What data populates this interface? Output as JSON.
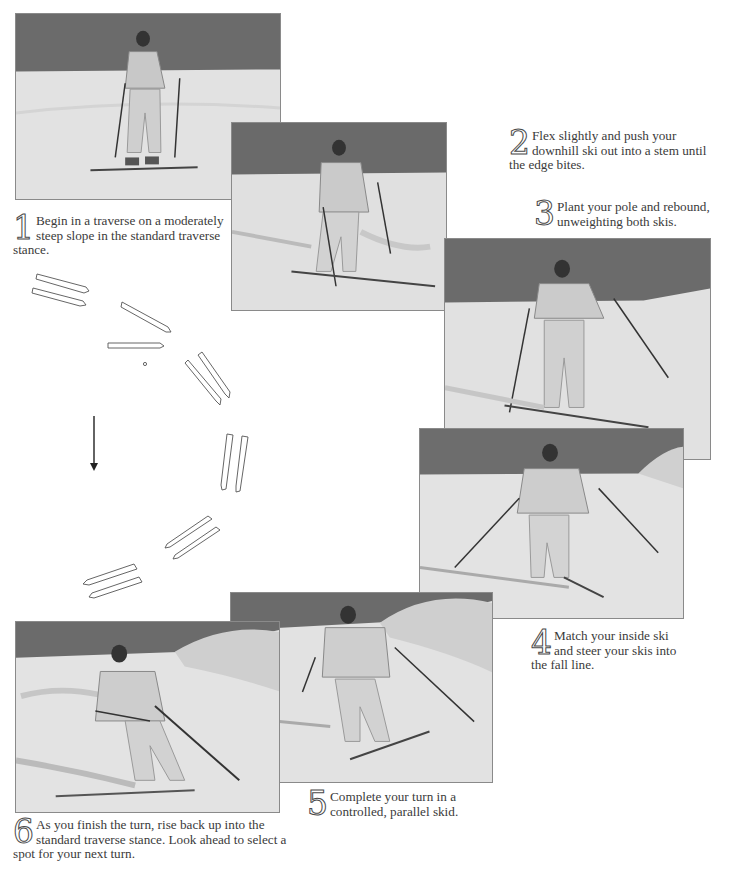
{
  "steps": [
    {
      "number": "1",
      "text": "Begin in a traverse on a moderately steep slope in the standard traverse stance."
    },
    {
      "number": "2",
      "text": "Flex slightly and push your downhill ski out into a stem until the edge bites."
    },
    {
      "number": "3",
      "text": "Plant your pole and rebound, unweighting both skis."
    },
    {
      "number": "4",
      "text": "Match your inside ski and steer your skis into the fall line."
    },
    {
      "number": "5",
      "text": "Complete your turn in a controlled, parallel skid."
    },
    {
      "number": "6",
      "text": "As you finish the turn, rise back up into the standard traverse stance. Look ahead to select a spot for your next turn."
    }
  ],
  "photos": [
    {
      "id": "step-1-photo",
      "subject": "skier in traverse stance"
    },
    {
      "id": "step-2-photo",
      "subject": "skier stemming downhill ski"
    },
    {
      "id": "step-3-photo",
      "subject": "skier planting pole"
    },
    {
      "id": "step-4-photo",
      "subject": "skier steering into fall line"
    },
    {
      "id": "step-5-photo",
      "subject": "skier in parallel skid"
    },
    {
      "id": "step-6-photo",
      "subject": "skier finishing turn"
    }
  ],
  "diagram": {
    "fall_line_arrow": "down-arrow-icon"
  },
  "colors": {
    "sky": "#6e6e6e",
    "snow": "#e4e4e4",
    "text": "#3a3a3a",
    "frame": "#8a8a8a"
  }
}
